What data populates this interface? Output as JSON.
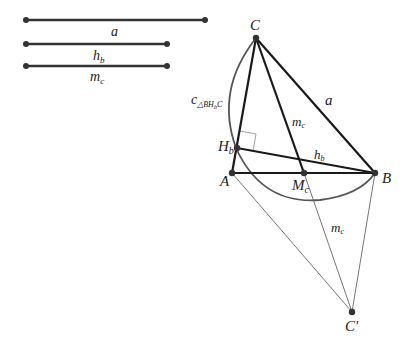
{
  "given_segments": [
    {
      "id": "a",
      "label": "a",
      "sub": ""
    },
    {
      "id": "hb",
      "label": "h",
      "sub": "b"
    },
    {
      "id": "mc",
      "label": "m",
      "sub": "c"
    }
  ],
  "points": {
    "C": {
      "label": "C"
    },
    "Hb": {
      "label": "H",
      "sub": "b"
    },
    "A": {
      "label": "A"
    },
    "B": {
      "label": "B"
    },
    "Mc": {
      "label": "M",
      "sub": "c"
    },
    "Cprime": {
      "label": "C'"
    }
  },
  "segment_labels": {
    "a": {
      "label": "a"
    },
    "hb": {
      "label": "h",
      "sub": "b"
    },
    "mc_upper": {
      "label": "m",
      "sub": "c"
    },
    "mc_lower": {
      "label": "m",
      "sub": "c"
    }
  },
  "circle_label": {
    "label": "c",
    "sub": "△BH",
    "subsub": "b",
    "tail": "C"
  },
  "colors": {
    "thick_line": "#1a1a1a",
    "thin_line": "#555555",
    "arc": "#555555",
    "point": "#333333",
    "right_angle": "#888888"
  }
}
